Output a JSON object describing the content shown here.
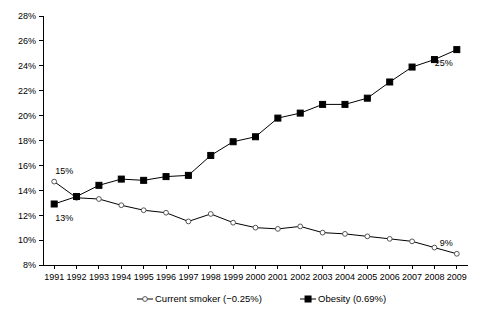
{
  "chart_data": {
    "type": "line",
    "title": "",
    "xlabel": "",
    "ylabel": "",
    "ylim": [
      8,
      28
    ],
    "ytick_labels": [
      "8%",
      "10%",
      "12%",
      "14%",
      "16%",
      "18%",
      "20%",
      "22%",
      "24%",
      "26%",
      "28%"
    ],
    "ytick_values": [
      8,
      10,
      12,
      14,
      16,
      18,
      20,
      22,
      24,
      26,
      28
    ],
    "grid": false,
    "legend_position": "bottom",
    "categories": [
      "1991",
      "1992",
      "1993",
      "1994",
      "1995",
      "1996",
      "1997",
      "1998",
      "1999",
      "2000",
      "2001",
      "2002",
      "2003",
      "2004",
      "2005",
      "2006",
      "2007",
      "2008",
      "2009"
    ],
    "series": [
      {
        "name": "Current smoker (−0.25%)",
        "marker": "open-circle",
        "values": [
          14.7,
          13.4,
          13.3,
          12.8,
          12.4,
          12.2,
          11.5,
          12.1,
          11.4,
          11.0,
          10.9,
          11.1,
          10.6,
          10.5,
          10.3,
          10.1,
          9.9,
          9.4,
          8.9
        ]
      },
      {
        "name": "Obesity (0.69%)",
        "marker": "filled-square",
        "values": [
          12.9,
          13.5,
          14.4,
          14.9,
          14.8,
          15.1,
          15.2,
          16.8,
          17.9,
          18.3,
          19.8,
          20.2,
          20.9,
          20.9,
          21.4,
          22.7,
          23.9,
          24.5,
          25.3
        ]
      }
    ],
    "annotations": [
      {
        "text": "15%",
        "series": "Current smoker (−0.25%)",
        "category": "1991",
        "value": 14.7,
        "position": "above-left"
      },
      {
        "text": "13%",
        "series": "Obesity (0.69%)",
        "category": "1991",
        "value": 12.9,
        "position": "below-left"
      },
      {
        "text": "25%",
        "series": "Obesity (0.69%)",
        "category": "2009",
        "value": 25.3,
        "position": "below-right"
      },
      {
        "text": "9%",
        "series": "Current smoker (−0.25%)",
        "category": "2009",
        "value": 8.9,
        "position": "above-right"
      }
    ]
  },
  "legend": {
    "items": [
      {
        "label": "Current smoker (−0.25%)",
        "marker": "open-circle"
      },
      {
        "label": "Obesity (0.69%)",
        "marker": "filled-square"
      }
    ]
  },
  "colors": {
    "axis": "#000000",
    "obesity_series": "#000000",
    "smoker_series": "#555555",
    "background": "#ffffff"
  }
}
